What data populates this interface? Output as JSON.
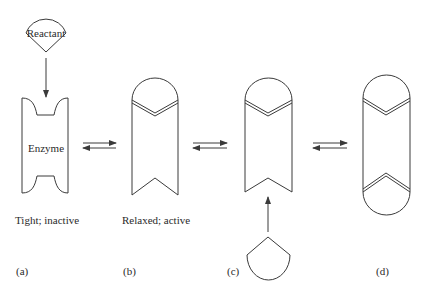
{
  "figure": {
    "reactant_label": "Reactant",
    "enzyme_label": "Enzyme",
    "states": [
      {
        "id": "a",
        "panel_label": "(a)",
        "caption": "Tight; inactive"
      },
      {
        "id": "b",
        "panel_label": "(b)",
        "caption": "Relaxed; active"
      },
      {
        "id": "c",
        "panel_label": "(c)",
        "caption": ""
      },
      {
        "id": "d",
        "panel_label": "(d)",
        "caption": ""
      }
    ],
    "equilibrium_arrows": 3,
    "colors": {
      "line": "#3a3a3a",
      "text": "#2a2a2a",
      "background": "#ffffff"
    }
  }
}
